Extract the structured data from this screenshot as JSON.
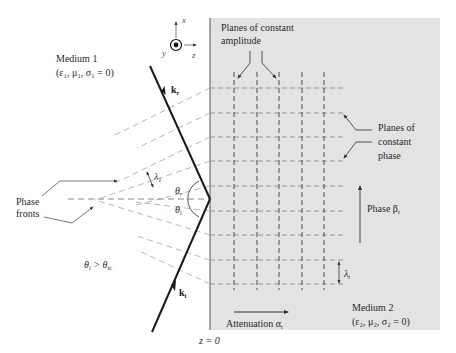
{
  "figure": {
    "type": "oblique-incidence-total-internal-reflection",
    "colors": {
      "medium2_fill": "#e3e3e3",
      "ray": "#1a1a1a",
      "dashed_medium1": "#b8b8b8",
      "dashed_medium2_horizontal": "#8a8a8a",
      "dashed_medium2_vertical": "#3a3a3a",
      "leader": "#444444",
      "text": "#2a2a2a"
    }
  },
  "axes": {
    "x_label": "x",
    "y_label": "y",
    "z_label": "z",
    "y_symbol": "out-of-page dot"
  },
  "medium1": {
    "name": "Medium 1",
    "params_prefix": "(ε",
    "params": "(ε₁, μ₁, σ₁ = 0)"
  },
  "medium2": {
    "name": "Medium 2",
    "params": "(ε₂, μ₂, σ₂ = 0)"
  },
  "labels": {
    "k_reflected": "k",
    "k_reflected_sub": "r",
    "k_incident": "k",
    "k_incident_sub": "i",
    "theta_r": "θ",
    "theta_r_sub": "r",
    "theta_i": "θ",
    "theta_i_sub": "i",
    "lambda1": "λ",
    "lambda1_sub": "1",
    "lambda_t": "λ",
    "lambda_t_sub": "t",
    "condition_theta": "θ",
    "condition_theta_sub": "i",
    "condition_op": " > θ",
    "condition_theta2_sub": "ic",
    "phase_fronts_line1": "Phase",
    "phase_fronts_line2": "fronts",
    "planes_amp_line1": "Planes of constant",
    "planes_amp_line2": "amplitude",
    "planes_phase_line1": "Planes of",
    "planes_phase_line2": "constant",
    "planes_phase_line3": "phase",
    "phase_beta": "Phase β",
    "phase_beta_sub": "t",
    "attenuation": "Attenuation α",
    "attenuation_sub": "t",
    "interface": "z = 0"
  }
}
